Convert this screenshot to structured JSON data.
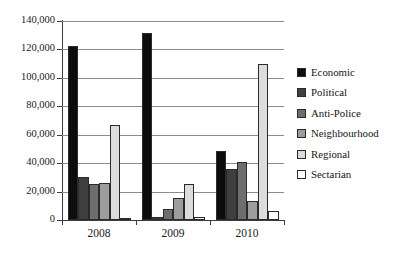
{
  "chart_data": {
    "type": "bar",
    "title": "",
    "subtitle": "",
    "xlabel": "",
    "ylabel": "",
    "categories": [
      "2008",
      "2009",
      "2010"
    ],
    "series": [
      {
        "name": "Economic",
        "color": "#0d0d0d",
        "values": [
          122500,
          131500,
          48500
        ]
      },
      {
        "name": "Political",
        "color": "#3f3f3f",
        "values": [
          30000,
          1800,
          36000
        ]
      },
      {
        "name": "Anti-Police",
        "color": "#6e6e6e",
        "values": [
          25000,
          7500,
          41000
        ]
      },
      {
        "name": "Neighbourhood",
        "color": "#9d9d9d",
        "values": [
          26000,
          15500,
          13500
        ]
      },
      {
        "name": "Regional",
        "color": "#dcdcdc",
        "values": [
          66500,
          25000,
          110000
        ]
      },
      {
        "name": "Sectarian",
        "color": "#ffffff",
        "values": [
          1200,
          2000,
          6000
        ]
      }
    ],
    "ylim": [
      0,
      140000
    ],
    "ytick_values": [
      0,
      20000,
      40000,
      60000,
      80000,
      100000,
      120000,
      140000
    ],
    "ytick_labels": [
      "0",
      "20,000",
      "40,000",
      "60,000",
      "80,000",
      "100,000",
      "120,000",
      "140,000"
    ],
    "grid": true,
    "legend_position": "right"
  },
  "legend": {
    "items": [
      {
        "label": "Economic"
      },
      {
        "label": "Political"
      },
      {
        "label": "Anti-Police"
      },
      {
        "label": "Neighbourhood"
      },
      {
        "label": "Regional"
      },
      {
        "label": "Sectarian"
      }
    ]
  }
}
